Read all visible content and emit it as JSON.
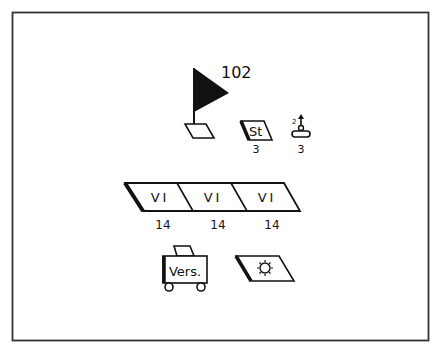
{
  "diagram": {
    "type": "tactical-symbol-diagram",
    "colors": {
      "stroke": "#111111",
      "background": "#ffffff",
      "frame": "#333333"
    },
    "flag": {
      "label": "102",
      "icon": "command-post-flag"
    },
    "staff_unit": {
      "label": "St",
      "count": "3"
    },
    "antenna_unit": {
      "superscript": "2",
      "count": "3",
      "icon": "antenna-on-base"
    },
    "vi_band": {
      "segments": [
        {
          "label": "VI",
          "count": "14"
        },
        {
          "label": "VI",
          "count": "14"
        },
        {
          "label": "VI",
          "count": "14"
        }
      ]
    },
    "supply_cart": {
      "label": "Vers.",
      "icon": "supply-cart"
    },
    "sun_unit": {
      "icon": "sun-symbol"
    }
  }
}
